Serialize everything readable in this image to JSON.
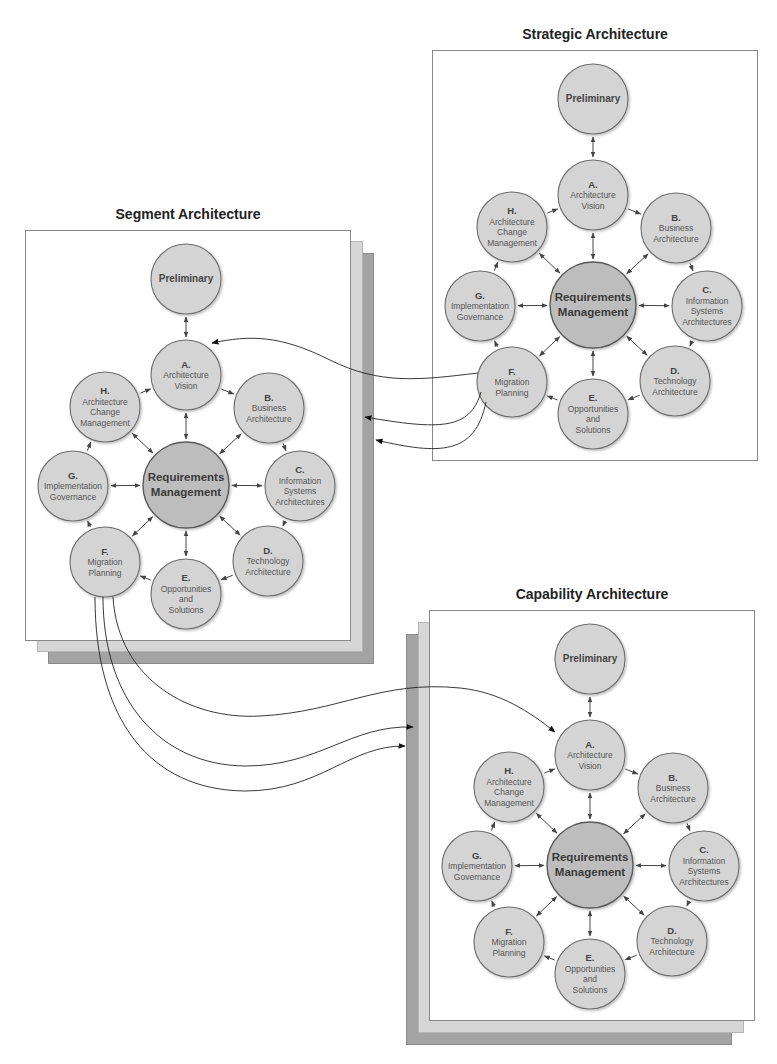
{
  "diagram": {
    "panels": [
      {
        "id": "strategic",
        "title": "Strategic Architecture",
        "origin": [
          432,
          50
        ],
        "stacked": false
      },
      {
        "id": "segment",
        "title": "Segment Architecture",
        "origin": [
          25,
          230
        ],
        "stacked": true,
        "stack_direction": "right-down"
      },
      {
        "id": "capability",
        "title": "Capability Architecture",
        "origin": [
          429,
          610
        ],
        "stacked": true,
        "stack_direction": "left-down"
      }
    ],
    "nodes": [
      {
        "id": "prelim",
        "letter": "",
        "lines": [
          "Preliminary"
        ],
        "pos": [
          161,
          49
        ],
        "r": 35,
        "style": "big"
      },
      {
        "id": "A",
        "letter": "A.",
        "lines": [
          "Architecture",
          "Vision"
        ],
        "pos": [
          161,
          145
        ],
        "r": 35
      },
      {
        "id": "B",
        "letter": "B.",
        "lines": [
          "Business",
          "Architecture"
        ],
        "pos": [
          244,
          178
        ],
        "r": 35
      },
      {
        "id": "C",
        "letter": "C.",
        "lines": [
          "Information",
          "Systems",
          "Architectures"
        ],
        "pos": [
          275,
          256
        ],
        "r": 35
      },
      {
        "id": "D",
        "letter": "D.",
        "lines": [
          "Technology",
          "Architecture"
        ],
        "pos": [
          243,
          331
        ],
        "r": 35
      },
      {
        "id": "E",
        "letter": "E.",
        "lines": [
          "Opportunities",
          "and",
          "Solutions"
        ],
        "pos": [
          161,
          364
        ],
        "r": 35
      },
      {
        "id": "F",
        "letter": "F.",
        "lines": [
          "Migration",
          "Planning"
        ],
        "pos": [
          80,
          332
        ],
        "r": 35
      },
      {
        "id": "G",
        "letter": "G.",
        "lines": [
          "Implementation",
          "Governance"
        ],
        "pos": [
          48,
          256
        ],
        "r": 35
      },
      {
        "id": "H",
        "letter": "H.",
        "lines": [
          "Architecture",
          "Change",
          "Management"
        ],
        "pos": [
          80,
          177
        ],
        "r": 35
      },
      {
        "id": "RM",
        "letter": "",
        "lines": [
          "Requirements",
          "Management"
        ],
        "pos": [
          161,
          255
        ],
        "r": 43,
        "style": "center"
      }
    ],
    "cycle_edges": [
      [
        "H",
        "A"
      ],
      [
        "A",
        "B"
      ],
      [
        "B",
        "C"
      ],
      [
        "C",
        "D"
      ],
      [
        "D",
        "E"
      ],
      [
        "E",
        "F"
      ],
      [
        "F",
        "G"
      ],
      [
        "G",
        "H"
      ]
    ],
    "bidirectional_edges": [
      [
        "prelim",
        "A"
      ],
      [
        "RM",
        "A"
      ],
      [
        "RM",
        "B"
      ],
      [
        "RM",
        "C"
      ],
      [
        "RM",
        "D"
      ],
      [
        "RM",
        "E"
      ],
      [
        "RM",
        "F"
      ],
      [
        "RM",
        "G"
      ],
      [
        "RM",
        "H"
      ]
    ],
    "cross_links": [
      {
        "from": "strategic.F",
        "to": "segment.A",
        "path": "M478 373 C 420 380, 380 385, 330 360 C 280 335, 250 335, 212 343"
      },
      {
        "from": "strategic.F",
        "to": "segment.stack",
        "path": "M481 392 C 470 430, 440 430, 365 417"
      },
      {
        "from": "strategic.F",
        "to": "segment.stack",
        "path": "M486 402 C 475 455, 440 455, 376 440"
      },
      {
        "from": "segment.F",
        "to": "capability.A",
        "path": "M113 597 C 118 680, 190 720, 260 716 C 340 712, 380 680, 460 688 C 500 692, 530 712, 555 732"
      },
      {
        "from": "segment.F",
        "to": "capability.stack",
        "path": "M103 597 C 103 700, 160 765, 245 766 C 320 766, 350 725, 413 727"
      },
      {
        "from": "segment.F",
        "to": "capability.stack",
        "path": "M95 597 C 95 720, 150 790, 245 791 C 320 791, 350 745, 405 746"
      }
    ],
    "colors": {
      "node_fill": "#d4d4d4",
      "node_stroke": "#6e6e6e",
      "center_fill": "#bdbdbd",
      "center_stroke": "#5a5a5a",
      "edge": "#444444",
      "sheet_light": "#d6d6d6",
      "sheet_dark": "#a3a3a3"
    }
  }
}
